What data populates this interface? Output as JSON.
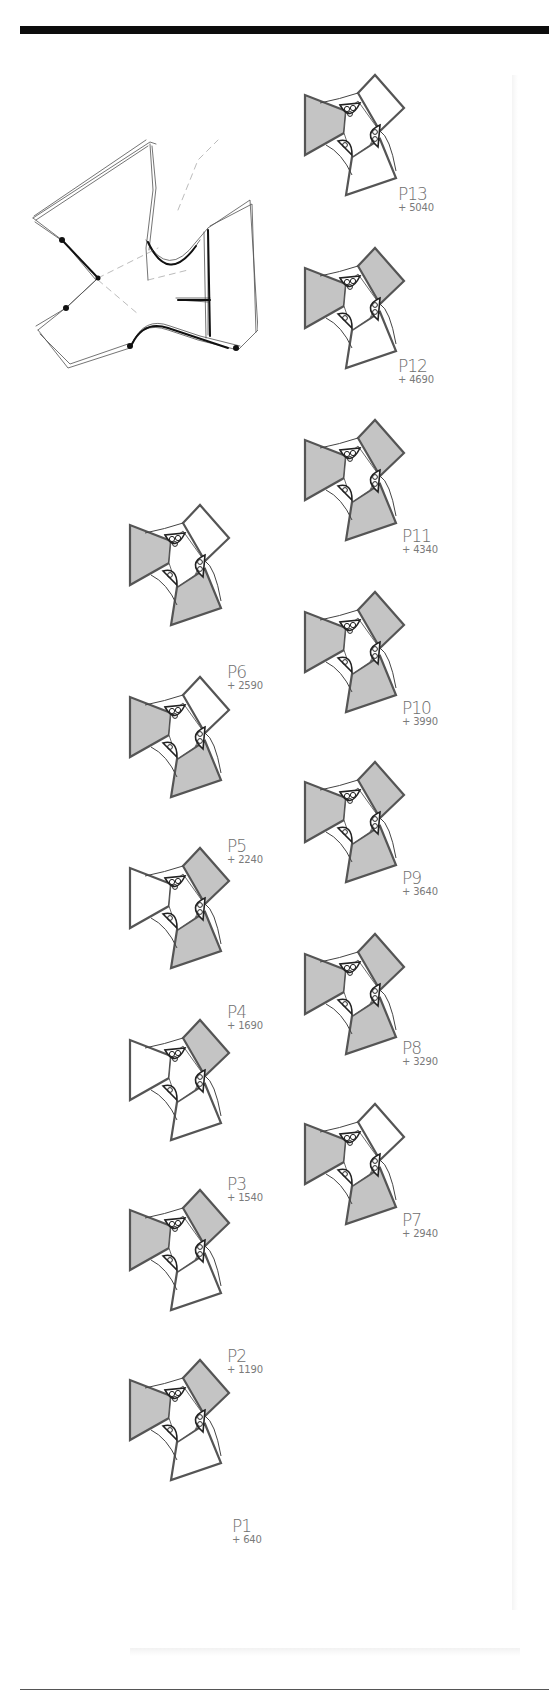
{
  "sheet": {
    "sketch_label": "concept-sketch",
    "colors": {
      "rule": "#0d0d0d",
      "outline": "#555555",
      "fill_shaded": "#c4c4c4",
      "fill_open": "#ffffff",
      "label": "#6a6a6a"
    }
  },
  "plans": [
    {
      "code": "P13",
      "elevation": "+ 5040",
      "x": 300,
      "y": 75,
      "lx": 398,
      "ly": 186,
      "shaded": [
        true,
        false,
        false
      ]
    },
    {
      "code": "P12",
      "elevation": "+ 4690",
      "x": 300,
      "y": 248,
      "lx": 398,
      "ly": 358,
      "shaded": [
        true,
        true,
        false
      ]
    },
    {
      "code": "P11",
      "elevation": "+ 4340",
      "x": 300,
      "y": 420,
      "lx": 402,
      "ly": 528,
      "shaded": [
        true,
        true,
        true
      ]
    },
    {
      "code": "P10",
      "elevation": "+ 3990",
      "x": 300,
      "y": 592,
      "lx": 402,
      "ly": 700,
      "shaded": [
        true,
        true,
        true
      ]
    },
    {
      "code": "P9",
      "elevation": "+ 3640",
      "x": 300,
      "y": 762,
      "lx": 402,
      "ly": 870,
      "shaded": [
        true,
        true,
        true
      ]
    },
    {
      "code": "P8",
      "elevation": "+ 3290",
      "x": 300,
      "y": 934,
      "lx": 402,
      "ly": 1040,
      "shaded": [
        true,
        true,
        true
      ]
    },
    {
      "code": "P7",
      "elevation": "+ 2940",
      "x": 300,
      "y": 1104,
      "lx": 402,
      "ly": 1212,
      "shaded": [
        true,
        false,
        true
      ]
    },
    {
      "code": "P6",
      "elevation": "+ 2590",
      "x": 125,
      "y": 505,
      "lx": 227,
      "ly": 664,
      "shaded": [
        true,
        false,
        true
      ]
    },
    {
      "code": "P5",
      "elevation": "+ 2240",
      "x": 125,
      "y": 677,
      "lx": 227,
      "ly": 838,
      "shaded": [
        true,
        false,
        true
      ]
    },
    {
      "code": "P4",
      "elevation": "+ 1690",
      "x": 125,
      "y": 848,
      "lx": 227,
      "ly": 1004,
      "shaded": [
        false,
        true,
        true
      ]
    },
    {
      "code": "P3",
      "elevation": "+ 1540",
      "x": 125,
      "y": 1020,
      "lx": 227,
      "ly": 1176,
      "shaded": [
        false,
        true,
        false
      ]
    },
    {
      "code": "P2",
      "elevation": "+ 1190",
      "x": 125,
      "y": 1190,
      "lx": 227,
      "ly": 1348,
      "shaded": [
        true,
        true,
        false
      ]
    },
    {
      "code": "P1",
      "elevation": "+ 640",
      "x": 125,
      "y": 1360,
      "lx": 232,
      "ly": 1518,
      "shaded": [
        true,
        true,
        false
      ]
    }
  ]
}
